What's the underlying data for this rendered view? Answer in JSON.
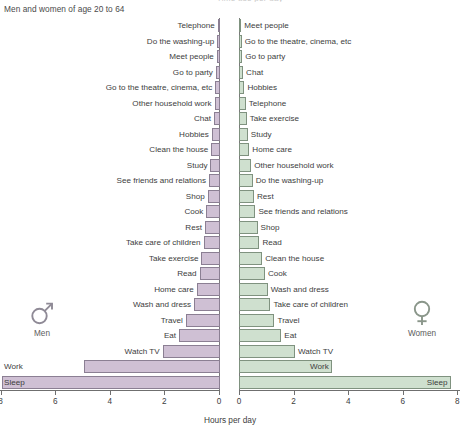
{
  "header": {
    "cut_title": "Time use per day",
    "subtitle": "Men and women of age 20 to 64"
  },
  "axis_title": "Hours per day",
  "legend": {
    "men": {
      "label": "Men",
      "icon": "mars-symbol-icon",
      "color": "#cfc0d4"
    },
    "women": {
      "label": "Women",
      "icon": "venus-symbol-icon",
      "color": "#cfe0cf"
    }
  },
  "chart_data": {
    "type": "bar",
    "orientation": "horizontal",
    "layout": "butterfly-back-to-back",
    "title": "Time use per day",
    "subtitle": "Men and women of age 20 to 64",
    "xlabel": "Hours per day",
    "ylabel": "",
    "grid": false,
    "legend_position": "inline-left-and-right",
    "panels": [
      {
        "name": "Men",
        "color": "#cfc0d4",
        "direction": "right-to-left",
        "xlim": [
          0,
          8
        ],
        "xticks": [
          8,
          6,
          4,
          2,
          0
        ],
        "xticklabels": [
          "8",
          "6",
          "4",
          "2",
          "0"
        ],
        "categories": [
          "Telephone",
          "Do the washing-up",
          "Meet people",
          "Go to party",
          "Go to the theatre, cinema, etc",
          "Other household work",
          "Chat",
          "Hobbies",
          "Clean the house",
          "Study",
          "See friends and relations",
          "Shop",
          "Cook",
          "Rest",
          "Take care of children",
          "Take exercise",
          "Read",
          "Home care",
          "Wash and dress",
          "Travel",
          "Eat",
          "Watch TV",
          "Work",
          "Sleep"
        ],
        "values": [
          0.08,
          0.1,
          0.12,
          0.15,
          0.17,
          0.2,
          0.22,
          0.3,
          0.32,
          0.35,
          0.4,
          0.45,
          0.5,
          0.55,
          0.6,
          0.68,
          0.75,
          0.85,
          0.95,
          1.25,
          1.5,
          2.1,
          5.0,
          8.0
        ]
      },
      {
        "name": "Women",
        "color": "#cfe0cf",
        "direction": "left-to-right",
        "xlim": [
          0,
          8
        ],
        "xticks": [
          0,
          2,
          4,
          6,
          8
        ],
        "xticklabels": [
          "0",
          "2",
          "4",
          "6",
          "8"
        ],
        "categories": [
          "Meet people",
          "Go to the theatre, cinema, etc",
          "Go to party",
          "Chat",
          "Hobbies",
          "Telephone",
          "Take exercise",
          "Study",
          "Home care",
          "Other household work",
          "Do the washing-up",
          "Rest",
          "See friends and relations",
          "Shop",
          "Read",
          "Clean the house",
          "Cook",
          "Wash and dress",
          "Take care of children",
          "Travel",
          "Eat",
          "Watch TV",
          "Work",
          "Sleep"
        ],
        "values": [
          0.08,
          0.1,
          0.12,
          0.15,
          0.2,
          0.25,
          0.28,
          0.32,
          0.38,
          0.45,
          0.5,
          0.55,
          0.6,
          0.68,
          0.75,
          0.85,
          0.95,
          1.05,
          1.15,
          1.3,
          1.55,
          2.05,
          3.4,
          7.75
        ]
      }
    ]
  }
}
